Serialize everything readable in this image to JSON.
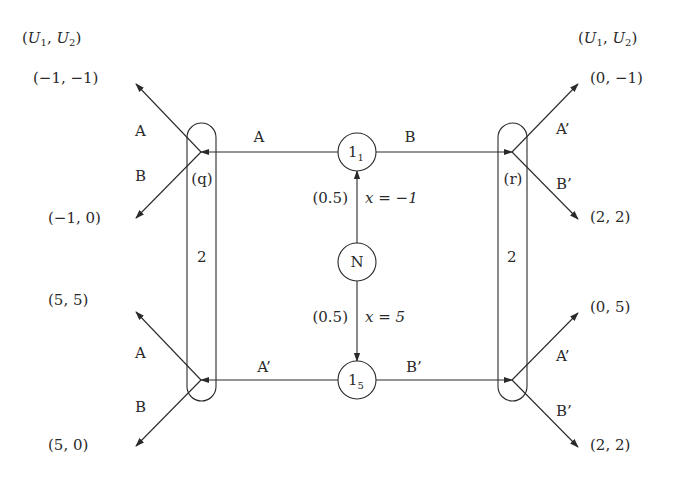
{
  "diagram": {
    "type": "extensive-form game tree",
    "payoff_header_left": "(U1, U2)",
    "payoff_header_right": "(U1, U2)",
    "nature": {
      "label": "N",
      "branches": [
        {
          "prob": "(0.5)",
          "event": "x = −1",
          "to": "1_1"
        },
        {
          "prob": "(0.5)",
          "event": "x = 5",
          "to": "1_5"
        }
      ]
    },
    "player1_nodes": [
      {
        "id": "1_1",
        "base": "1",
        "sub": "1",
        "left_action": "A",
        "right_action": "B"
      },
      {
        "id": "1_5",
        "base": "1",
        "sub": "5",
        "left_action": "A’",
        "right_action": "B’"
      }
    ],
    "player2_info_sets": [
      {
        "side": "left",
        "player": "2",
        "belief_label": "(q)"
      },
      {
        "side": "right",
        "player": "2",
        "belief_label": "(r)"
      }
    ],
    "terminal_payoffs": {
      "left_top": {
        "upper_action": "A",
        "lower_action": "B",
        "upper_payoff": "(−1, −1)",
        "lower_payoff": "(−1, 0)"
      },
      "left_bottom": {
        "upper_action": "A",
        "lower_action": "B",
        "upper_payoff": "(5, 5)",
        "lower_payoff": "(5, 0)"
      },
      "right_top": {
        "upper_action": "A’",
        "lower_action": "B’",
        "upper_payoff": "(0, −1)",
        "lower_payoff": "(2, 2)"
      },
      "right_bottom": {
        "upper_action": "A’",
        "lower_action": "B’",
        "upper_payoff": "(0, 5)",
        "lower_payoff": "(2, 2)"
      }
    }
  }
}
